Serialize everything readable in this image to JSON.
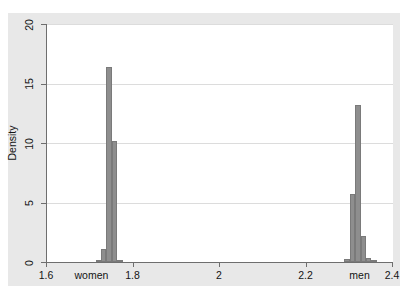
{
  "chart_data": {
    "type": "bar",
    "title": "",
    "xlabel": "",
    "ylabel": "Density",
    "xlim": [
      1.6,
      2.4
    ],
    "ylim": [
      0,
      20
    ],
    "grid": true,
    "legend": null,
    "xticks": [
      {
        "value": 1.6,
        "label": "1.6"
      },
      {
        "value": 1.8,
        "label": "1.8"
      },
      {
        "value": 2.0,
        "label": "2"
      },
      {
        "value": 2.2,
        "label": "2.2"
      },
      {
        "value": 2.4,
        "label": "2.4"
      }
    ],
    "yticks": [
      {
        "value": 0,
        "label": "0"
      },
      {
        "value": 5,
        "label": "5"
      },
      {
        "value": 10,
        "label": "10"
      },
      {
        "value": 15,
        "label": "15"
      },
      {
        "value": 20,
        "label": "20"
      }
    ],
    "category_annotations": [
      {
        "value": 1.705,
        "label": "women"
      },
      {
        "value": 2.325,
        "label": "men"
      }
    ],
    "bar_color": "#8e8e8e",
    "bin_width": 0.0125,
    "series": [
      {
        "name": "women",
        "bins": [
          {
            "x0": 1.7125,
            "x1": 1.725,
            "height": 0.15
          },
          {
            "x0": 1.725,
            "x1": 1.7375,
            "height": 1.1
          },
          {
            "x0": 1.7375,
            "x1": 1.75,
            "height": 16.4
          },
          {
            "x0": 1.75,
            "x1": 1.7625,
            "height": 10.2
          },
          {
            "x0": 1.7625,
            "x1": 1.775,
            "height": 0.2
          }
        ]
      },
      {
        "name": "men",
        "bins": [
          {
            "x0": 2.2875,
            "x1": 2.3,
            "height": 0.25
          },
          {
            "x0": 2.3,
            "x1": 2.3125,
            "height": 5.7
          },
          {
            "x0": 2.3125,
            "x1": 2.325,
            "height": 13.2
          },
          {
            "x0": 2.325,
            "x1": 2.3375,
            "height": 2.2
          },
          {
            "x0": 2.3375,
            "x1": 2.35,
            "height": 0.3
          },
          {
            "x0": 2.35,
            "x1": 2.3625,
            "height": 0.15
          }
        ]
      }
    ]
  },
  "colors": {
    "bar": "#8e8e8e",
    "grid": "#dcdcdc",
    "axis": "#6e6e6e",
    "plot_background": "#ffffff",
    "graph_background": "#e8e8e8"
  }
}
